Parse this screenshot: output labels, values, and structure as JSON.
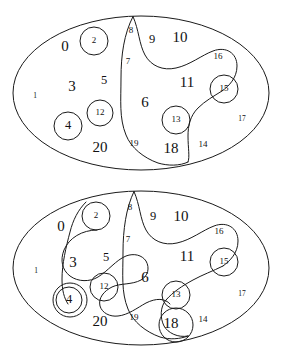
{
  "figure": {
    "stroke_color": "#1a1a1a",
    "background_color": "#ffffff",
    "diagram_count": 2
  },
  "diagrams": [
    {
      "id": "top-diagram",
      "name": "upper-partition-diagram",
      "outer_shape": "ellipse",
      "outer": {
        "cx": 141,
        "cy": 93,
        "rx": 128,
        "ry": 77
      },
      "labels": [
        {
          "id": "t0",
          "text": "0",
          "x": 65,
          "y": 48,
          "size": "big"
        },
        {
          "id": "t2",
          "text": "2",
          "x": 94,
          "y": 41,
          "size": "small"
        },
        {
          "id": "t8",
          "text": "8",
          "x": 131,
          "y": 31,
          "size": "small"
        },
        {
          "id": "t9",
          "text": "9",
          "x": 152,
          "y": 40,
          "size": "mid"
        },
        {
          "id": "t10",
          "text": "10",
          "x": 180,
          "y": 39,
          "size": "big"
        },
        {
          "id": "t16",
          "text": "16",
          "x": 218,
          "y": 57,
          "size": "small"
        },
        {
          "id": "t7",
          "text": "7",
          "x": 128,
          "y": 62,
          "size": "small"
        },
        {
          "id": "t5",
          "text": "5",
          "x": 104,
          "y": 81,
          "size": "mid"
        },
        {
          "id": "t3",
          "text": "3",
          "x": 72,
          "y": 88,
          "size": "big"
        },
        {
          "id": "t11",
          "text": "11",
          "x": 187,
          "y": 84,
          "size": "big"
        },
        {
          "id": "t15",
          "text": "15",
          "x": 224,
          "y": 89,
          "size": "small"
        },
        {
          "id": "t1",
          "text": "1",
          "x": 35,
          "y": 96,
          "size": "tiny"
        },
        {
          "id": "t12",
          "text": "12",
          "x": 100,
          "y": 113,
          "size": "small"
        },
        {
          "id": "t6",
          "text": "6",
          "x": 145,
          "y": 104,
          "size": "big"
        },
        {
          "id": "t13",
          "text": "13",
          "x": 176,
          "y": 120,
          "size": "small"
        },
        {
          "id": "t4",
          "text": "4",
          "x": 68,
          "y": 126,
          "size": "mid"
        },
        {
          "id": "t17",
          "text": "17",
          "x": 242,
          "y": 119,
          "size": "tiny"
        },
        {
          "id": "t19",
          "text": "19",
          "x": 134,
          "y": 144,
          "size": "small"
        },
        {
          "id": "t20",
          "text": "20",
          "x": 100,
          "y": 149,
          "size": "big"
        },
        {
          "id": "t18",
          "text": "18",
          "x": 171,
          "y": 150,
          "size": "big"
        },
        {
          "id": "t14",
          "text": "14",
          "x": 203,
          "y": 145,
          "size": "small"
        }
      ],
      "circles": [
        {
          "id": "tc2",
          "label": "2",
          "cx": 94,
          "cy": 41,
          "r": 14
        },
        {
          "id": "tc12",
          "label": "12",
          "cx": 100,
          "cy": 113,
          "r": 13
        },
        {
          "id": "tc4",
          "label": "4",
          "cx": 68,
          "cy": 126,
          "r": 14
        },
        {
          "id": "tc13",
          "label": "13",
          "cx": 176,
          "cy": 120,
          "r": 14
        },
        {
          "id": "tc15",
          "label": "15",
          "cx": 224,
          "cy": 89,
          "r": 14
        }
      ]
    },
    {
      "id": "bottom-diagram",
      "name": "lower-partition-diagram",
      "outer_shape": "ellipse",
      "outer": {
        "cx": 141,
        "cy": 88,
        "rx": 128,
        "ry": 77
      },
      "labels": [
        {
          "id": "b0",
          "text": "0",
          "x": 61,
          "y": 48,
          "size": "big"
        },
        {
          "id": "b2",
          "text": "2",
          "x": 96,
          "y": 36,
          "size": "small"
        },
        {
          "id": "b8",
          "text": "8",
          "x": 130,
          "y": 28,
          "size": "small"
        },
        {
          "id": "b9",
          "text": "9",
          "x": 153,
          "y": 37,
          "size": "mid"
        },
        {
          "id": "b10",
          "text": "10",
          "x": 181,
          "y": 38,
          "size": "big"
        },
        {
          "id": "b16",
          "text": "16",
          "x": 219,
          "y": 52,
          "size": "small"
        },
        {
          "id": "b7",
          "text": "7",
          "x": 128,
          "y": 60,
          "size": "small"
        },
        {
          "id": "b5",
          "text": "5",
          "x": 106,
          "y": 78,
          "size": "mid"
        },
        {
          "id": "b3",
          "text": "3",
          "x": 73,
          "y": 84,
          "size": "big"
        },
        {
          "id": "b11",
          "text": "11",
          "x": 187,
          "y": 78,
          "size": "big"
        },
        {
          "id": "b15",
          "text": "15",
          "x": 224,
          "y": 82,
          "size": "small"
        },
        {
          "id": "b1",
          "text": "1",
          "x": 36,
          "y": 91,
          "size": "tiny"
        },
        {
          "id": "b6",
          "text": "6",
          "x": 145,
          "y": 99,
          "size": "big"
        },
        {
          "id": "b12",
          "text": "12",
          "x": 104,
          "y": 107,
          "size": "small"
        },
        {
          "id": "b13",
          "text": "13",
          "x": 176,
          "y": 115,
          "size": "small"
        },
        {
          "id": "b4",
          "text": "4",
          "x": 69,
          "y": 120,
          "size": "mid"
        },
        {
          "id": "b17",
          "text": "17",
          "x": 242,
          "y": 114,
          "size": "tiny"
        },
        {
          "id": "b19",
          "text": "19",
          "x": 134,
          "y": 138,
          "size": "small"
        },
        {
          "id": "b20",
          "text": "20",
          "x": 100,
          "y": 143,
          "size": "big"
        },
        {
          "id": "b18",
          "text": "18",
          "x": 171,
          "y": 145,
          "size": "big"
        },
        {
          "id": "b14",
          "text": "14",
          "x": 203,
          "y": 140,
          "size": "small"
        }
      ],
      "circles": [
        {
          "id": "bc2",
          "label": "2",
          "cx": 96,
          "cy": 36,
          "r": 14
        },
        {
          "id": "bc12",
          "label": "12",
          "cx": 104,
          "cy": 107,
          "r": 14
        },
        {
          "id": "bc4",
          "label": "4",
          "cx": 69,
          "cy": 120,
          "r": 13
        },
        {
          "id": "bc13",
          "label": "13",
          "cx": 176,
          "cy": 115,
          "r": 14
        },
        {
          "id": "bc15",
          "label": "15",
          "cx": 224,
          "cy": 82,
          "r": 14
        }
      ]
    }
  ]
}
